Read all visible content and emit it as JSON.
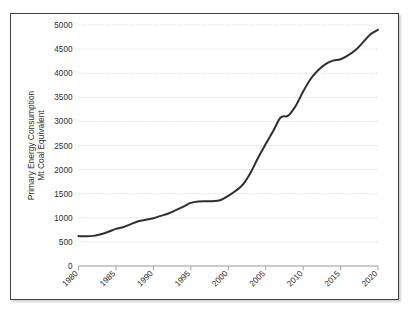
{
  "chart_data": {
    "type": "line",
    "title": "",
    "xlabel": "",
    "ylabel": "Primary Energy Consumption\nMt Coal Equivalent",
    "ylabel_line1": "Primary Energy Consumption",
    "ylabel_line2": "Mt Coal Equivalent",
    "xlim": [
      1980,
      2020
    ],
    "ylim": [
      0,
      5000
    ],
    "grid": true,
    "legend": false,
    "legend_position": "none",
    "line_color": "#2e2e2e",
    "gridline_color": "#bfbfbf",
    "axis_color": "#9a9a9a",
    "frame_color": "#3f3f3f",
    "ytick_labels": [
      "0",
      "500",
      "1000",
      "1500",
      "2000",
      "2500",
      "3000",
      "3500",
      "4000",
      "4500",
      "5000"
    ],
    "ytick_values": [
      0,
      500,
      1000,
      1500,
      2000,
      2500,
      3000,
      3500,
      4000,
      4500,
      5000
    ],
    "xtick_labels": [
      "1980",
      "1985",
      "1990",
      "1995",
      "2000",
      "2005",
      "2010",
      "2015",
      "2020"
    ],
    "xtick_values": [
      1980,
      1985,
      1990,
      1995,
      2000,
      2005,
      2010,
      2015,
      2020
    ],
    "xtick_rotation": 45,
    "series": [
      {
        "name": "Primary Energy Consumption",
        "x": [
          1980,
          1981,
          1982,
          1983,
          1984,
          1985,
          1986,
          1987,
          1988,
          1989,
          1990,
          1991,
          1992,
          1993,
          1994,
          1995,
          1996,
          1997,
          1998,
          1999,
          2000,
          2001,
          2002,
          2003,
          2004,
          2005,
          2006,
          2007,
          2008,
          2009,
          2010,
          2011,
          2012,
          2013,
          2014,
          2015,
          2016,
          2017,
          2018,
          2019,
          2020
        ],
        "values": [
          620,
          615,
          625,
          660,
          710,
          770,
          810,
          870,
          930,
          960,
          990,
          1040,
          1090,
          1160,
          1230,
          1310,
          1340,
          1345,
          1345,
          1370,
          1455,
          1560,
          1700,
          1940,
          2250,
          2530,
          2800,
          3080,
          3120,
          3320,
          3620,
          3880,
          4060,
          4190,
          4260,
          4290,
          4370,
          4480,
          4640,
          4810,
          4900
        ]
      }
    ]
  },
  "axes": {
    "ylabel_line1": "Primary Energy Consumption",
    "ylabel_line2": "Mt Coal Equivalent"
  }
}
